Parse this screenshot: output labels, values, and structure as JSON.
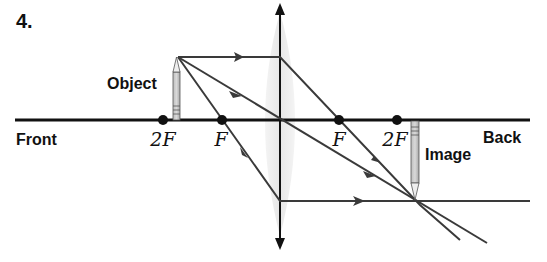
{
  "problem_number": "4.",
  "labels": {
    "object": "Object",
    "image": "Image",
    "front": "Front",
    "back": "Back"
  },
  "focal_points": [
    {
      "id": "2F-front",
      "label": "2F"
    },
    {
      "id": "F-front",
      "label": "F"
    },
    {
      "id": "F-back",
      "label": "F"
    },
    {
      "id": "2F-back",
      "label": "2F"
    }
  ],
  "lens": {
    "type": "converging"
  },
  "rays": [
    {
      "id": "parallel-ray",
      "description": "parallel to axis, refracts through back F"
    },
    {
      "id": "center-ray",
      "description": "through lens center, undeviated"
    },
    {
      "id": "focal-ray",
      "description": "through front F, exits parallel"
    }
  ],
  "colors": {
    "ray": "#3a3a3a",
    "axis": "#111111",
    "lens_fill": "#e6e6e6"
  }
}
